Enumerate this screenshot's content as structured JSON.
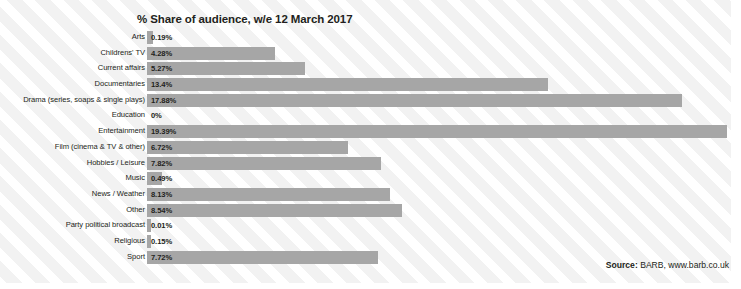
{
  "chart_data": {
    "type": "bar",
    "orientation": "horizontal",
    "title": "% Share of audience, w/e 12 March 2017",
    "xlabel": "",
    "ylabel": "",
    "xlim": [
      0,
      20
    ],
    "grid": false,
    "legend": null,
    "bar_color": "#a6a6a6",
    "value_suffix": "%",
    "categories": [
      "Arts",
      "Childrens' TV",
      "Current affairs",
      "Documentaries",
      "Drama (series, soaps & single plays)",
      "Education",
      "Entertainment",
      "Film (cinema & TV & other)",
      "Hobbies / Leisure",
      "Music",
      "News / Weather",
      "Other",
      "Party political broadcast",
      "Religious",
      "Sport"
    ],
    "values": [
      0.19,
      4.28,
      5.27,
      13.4,
      17.88,
      0,
      19.39,
      6.72,
      7.82,
      0.49,
      8.13,
      8.54,
      0.01,
      0.15,
      7.72
    ],
    "data_labels": [
      "0.19%",
      "4.28%",
      "5.27%",
      "13.4%",
      "17.88%",
      "0%",
      "19.39%",
      "6.72%",
      "7.82%",
      "0.49%",
      "8.13%",
      "8.54%",
      "0.01%",
      "0.15%",
      "7.72%"
    ]
  },
  "source": {
    "prefix": "Source:",
    "text": " BARB, www.barb.co.uk"
  }
}
